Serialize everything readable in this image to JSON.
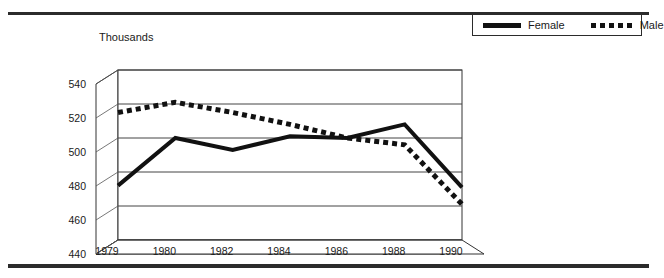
{
  "figure": {
    "clipped_title_fragment": "",
    "unit_label": "Thousands"
  },
  "legend": {
    "position": "top-right",
    "entries": [
      {
        "label": "Female",
        "style": "solid",
        "swatch": "solid-line-swatch",
        "color": "#111111"
      },
      {
        "label": "Male",
        "style": "dotted",
        "swatch": "dotted-line-swatch",
        "color": "#111111"
      }
    ]
  },
  "chart_data": {
    "type": "line",
    "title": "",
    "xlabel": "",
    "ylabel": "Thousands",
    "ylim": [
      440,
      540
    ],
    "yticks": [
      440,
      460,
      480,
      500,
      520,
      540
    ],
    "xticks": [
      "1979",
      "1980",
      "1982",
      "1984",
      "1986",
      "1988",
      "1990"
    ],
    "x": [
      1979,
      1980,
      1982,
      1984,
      1986,
      1988,
      1990
    ],
    "grid": true,
    "style_3d": true,
    "legend_position": "top-right",
    "series": [
      {
        "name": "Female",
        "style": "solid",
        "values": [
          472,
          500,
          493,
          501,
          500,
          508,
          471
        ]
      },
      {
        "name": "Male",
        "style": "dotted",
        "values": [
          515,
          521,
          515,
          508,
          500,
          496,
          461
        ]
      }
    ]
  }
}
